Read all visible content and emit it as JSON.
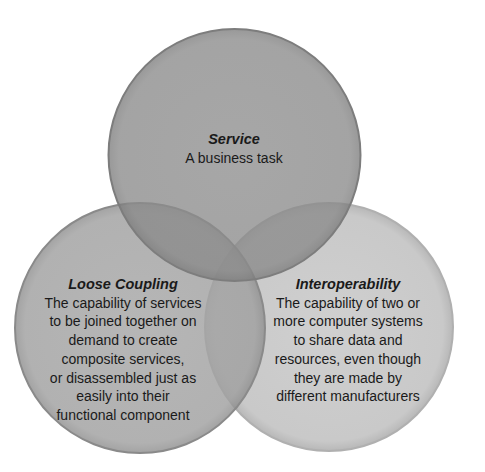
{
  "diagram": {
    "type": "venn",
    "circles": [
      {
        "id": "service",
        "title": "Service",
        "lines": [
          "A business task"
        ],
        "cx": 234.5,
        "cy": 155,
        "r": 126,
        "fill": "#8c8c8c"
      },
      {
        "id": "loose-coupling",
        "title": "Loose Coupling",
        "lines": [
          "The capability of services",
          "to be joined together on",
          "demand to create",
          "composite services,",
          "or disassembled just as",
          "easily into their",
          "functional component"
        ],
        "cx": 140,
        "cy": 328,
        "r": 125,
        "fill": "#a3a3a3"
      },
      {
        "id": "interoperability",
        "title": "Interoperability",
        "lines": [
          "The capability of two or",
          "more computer systems",
          "to share data and",
          "resources, even though",
          "they are made by",
          "different manufacturers"
        ],
        "cx": 329,
        "cy": 327,
        "r": 124,
        "fill": "#c9c9c9"
      }
    ],
    "colors": {
      "stroke": "#7a7a7a",
      "overlap_service_loose": "#7e7e7e",
      "overlap_center": "#707070",
      "text": "#1a1a1a",
      "background": "#ffffff"
    }
  }
}
